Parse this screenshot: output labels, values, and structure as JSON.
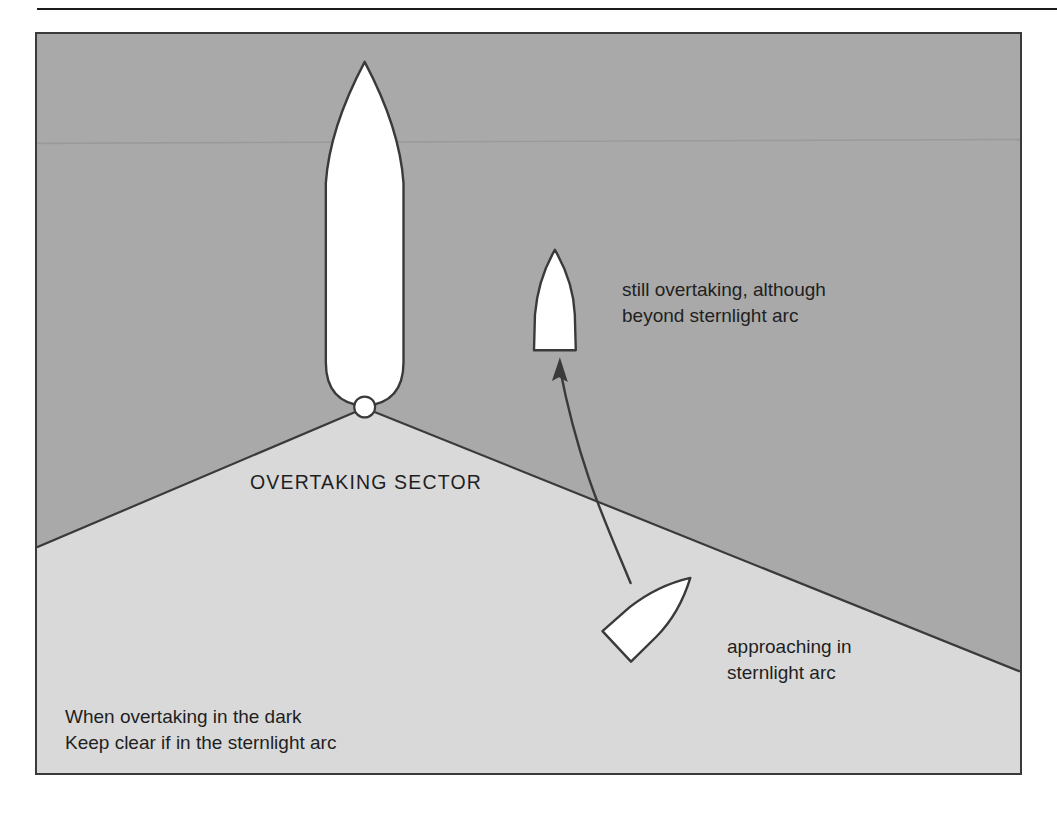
{
  "figure": {
    "sector_label": "OVERTAKING SECTOR",
    "annotations": {
      "upper_vessel": "still overtaking, although\nbeyond sternlight arc",
      "lower_vessel": "approaching in\nsternlight arc"
    },
    "caption": "When overtaking in the dark\nKeep clear if in the sternlight arc",
    "colors": {
      "upper_background": "#a9a9a9",
      "sector_background": "#d9d9d9",
      "outline": "#3a3a3a",
      "vessel_fill": "#ffffff",
      "text": "#1f1f1f",
      "rule": "#1c1c1c"
    },
    "elements": {
      "main_vessel_name": "overtaken-vessel",
      "sternlight_name": "sternlight-lamp",
      "upper_vessel_name": "overtaking-vessel-beyond-arc",
      "lower_vessel_name": "overtaking-vessel-in-arc",
      "arrow_name": "vessel-track-arrow",
      "horizon_name": "horizon-line"
    }
  }
}
